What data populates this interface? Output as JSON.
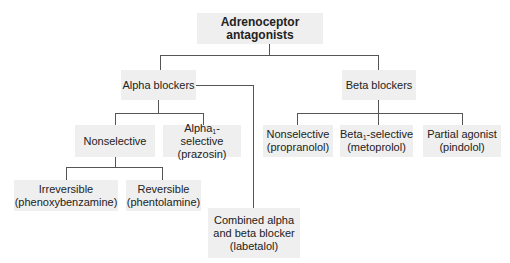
{
  "diagram": {
    "root": {
      "label": "Adrenoceptor antagonists"
    },
    "alpha": {
      "label": "Alpha blockers",
      "nonselective": {
        "label": "Nonselective"
      },
      "alpha1": {
        "prefix": "Alpha",
        "sub": "1",
        "suffix": "-selective",
        "example": "(prazosin)"
      },
      "irreversible": {
        "label": "Irreversible",
        "example": "(phenoxybenzamine)"
      },
      "reversible": {
        "label": "Reversible",
        "example": "(phentolamine)"
      }
    },
    "beta": {
      "label": "Beta blockers",
      "nonselective": {
        "label": "Nonselective",
        "example": "(propranolol)"
      },
      "beta1": {
        "prefix": "Beta",
        "sub": "1",
        "suffix": "-selective",
        "example": "(metoprolol)"
      },
      "partial": {
        "label": "Partial agonist",
        "example": "(pindolol)"
      }
    },
    "combined": {
      "line1": "Combined alpha",
      "line2": "and beta blocker",
      "example": "(labetalol)"
    }
  },
  "colors": {
    "box_fill": "#efefef",
    "line": "#555555",
    "text": "#222222"
  }
}
